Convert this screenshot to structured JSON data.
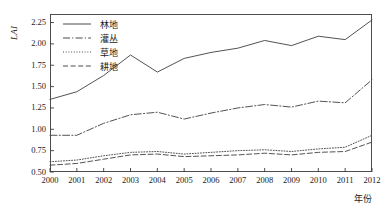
{
  "axes": {
    "ylabel": "LAI",
    "xlabel": "年份",
    "yticks": [
      "0.50",
      "0.75",
      "1.00",
      "1.25",
      "1.50",
      "1.75",
      "2.00",
      "2.25"
    ],
    "ytick_values": [
      0.5,
      0.75,
      1.0,
      1.25,
      1.5,
      1.75,
      2.0,
      2.25
    ],
    "xticks": [
      "2000",
      "2001",
      "2002",
      "2003",
      "2004",
      "2005",
      "2006",
      "2007",
      "2008",
      "2009",
      "2010",
      "2011",
      "2012"
    ]
  },
  "legend": {
    "position": "top-left",
    "items": [
      {
        "label": "林地",
        "style": "solid",
        "key": "line-key-solid"
      },
      {
        "label": "灌丛",
        "style": "dashdot",
        "key": "line-key-dashdot"
      },
      {
        "label": "草地",
        "style": "dotted",
        "key": "line-key-dotted"
      },
      {
        "label": "耕地",
        "style": "dashed",
        "key": "line-key-dashed"
      }
    ]
  },
  "colors": {
    "axis": "#3c3c3c",
    "line": "#4a4a4a",
    "background": "#ffffff"
  },
  "chart_data": {
    "type": "line",
    "title": "",
    "xlabel": "年份",
    "ylabel": "LAI",
    "xlim": [
      2000,
      2012
    ],
    "ylim": [
      0.5,
      2.35
    ],
    "grid": false,
    "legend_position": "top-left",
    "x": [
      2000,
      2001,
      2002,
      2003,
      2004,
      2005,
      2006,
      2007,
      2008,
      2009,
      2010,
      2011,
      2012
    ],
    "categories": [
      "2000",
      "2001",
      "2002",
      "2003",
      "2004",
      "2005",
      "2006",
      "2007",
      "2008",
      "2009",
      "2010",
      "2011",
      "2012"
    ],
    "series": [
      {
        "name": "林地",
        "style": "solid",
        "values": [
          1.35,
          1.44,
          1.63,
          1.87,
          1.67,
          1.83,
          1.9,
          1.95,
          2.04,
          1.98,
          2.09,
          2.05,
          2.28
        ]
      },
      {
        "name": "灌丛",
        "style": "dashdot",
        "values": [
          0.93,
          0.93,
          1.07,
          1.17,
          1.2,
          1.12,
          1.19,
          1.25,
          1.29,
          1.26,
          1.33,
          1.31,
          1.58
        ]
      },
      {
        "name": "草地",
        "style": "dotted",
        "values": [
          0.62,
          0.64,
          0.69,
          0.73,
          0.74,
          0.71,
          0.73,
          0.75,
          0.76,
          0.74,
          0.77,
          0.79,
          0.93
        ]
      },
      {
        "name": "耕地",
        "style": "dashed",
        "values": [
          0.58,
          0.6,
          0.65,
          0.7,
          0.71,
          0.68,
          0.69,
          0.7,
          0.72,
          0.7,
          0.73,
          0.74,
          0.85
        ]
      }
    ]
  }
}
